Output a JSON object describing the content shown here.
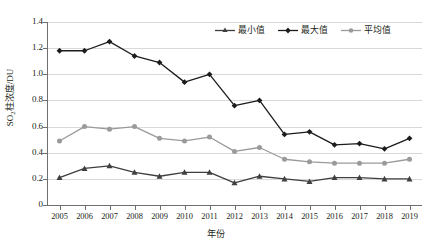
{
  "chart_data": {
    "type": "line",
    "title": "",
    "xlabel": "年份",
    "ylabel": "SO₂柱浓度/DU",
    "ylabel_main": "柱浓度/DU",
    "ylabel_prefix": "SO",
    "ylabel_sub": "2",
    "categories": [
      "2005",
      "2006",
      "2007",
      "2008",
      "2009",
      "2010",
      "2011",
      "2012",
      "2013",
      "2014",
      "2015",
      "2016",
      "2017",
      "2018",
      "2019"
    ],
    "ylim": [
      0,
      1.4
    ],
    "yticks": [
      "0",
      "0.2",
      "0.4",
      "0.6",
      "0.8",
      "1.0",
      "1.2",
      "1.4"
    ],
    "ytick_values": [
      0,
      0.2,
      0.4,
      0.6,
      0.8,
      1.0,
      1.2,
      1.4
    ],
    "grid": true,
    "grid_axis": "y",
    "legend_position": "top-right",
    "series": [
      {
        "name": "最小值",
        "color": "#3f3f3f",
        "marker": "triangle",
        "values": [
          0.21,
          0.28,
          0.3,
          0.25,
          0.22,
          0.25,
          0.25,
          0.17,
          0.22,
          0.2,
          0.18,
          0.21,
          0.21,
          0.2,
          0.2
        ]
      },
      {
        "name": "最大值",
        "color": "#1c1c1c",
        "marker": "diamond",
        "values": [
          1.18,
          1.18,
          1.25,
          1.14,
          1.09,
          0.94,
          1.0,
          0.76,
          0.8,
          0.54,
          0.56,
          0.46,
          0.47,
          0.43,
          0.51
        ]
      },
      {
        "name": "平均值",
        "color": "#9a9a9a",
        "marker": "circle",
        "values": [
          0.49,
          0.6,
          0.58,
          0.6,
          0.51,
          0.49,
          0.52,
          0.41,
          0.44,
          0.35,
          0.33,
          0.32,
          0.32,
          0.32,
          0.35
        ]
      }
    ]
  },
  "legend": {
    "items": [
      {
        "label": "最小值"
      },
      {
        "label": "最大值"
      },
      {
        "label": "平均值"
      }
    ]
  },
  "axes": {
    "x_title": "年份",
    "y_title_prefix": "SO",
    "y_title_sub": "2",
    "y_title_rest": "柱浓度/DU"
  }
}
